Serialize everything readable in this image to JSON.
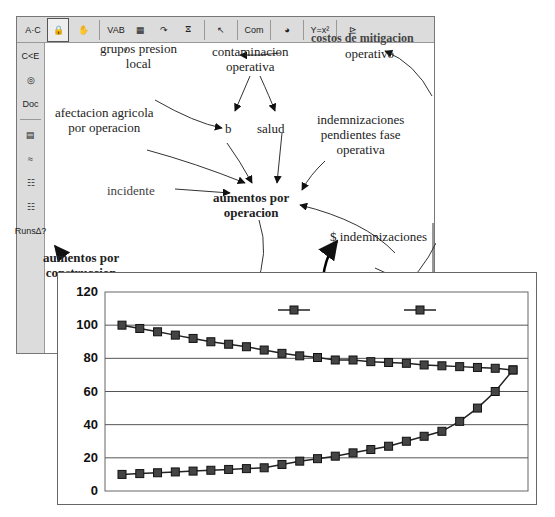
{
  "toolbar": {
    "items": [
      {
        "name": "text-tool",
        "glyph": "A·C"
      },
      {
        "name": "lock-tool",
        "glyph": "🔒",
        "selected": true
      },
      {
        "name": "hand-tool",
        "glyph": "✋"
      },
      {
        "name": "variable-tool",
        "glyph": "VAB"
      },
      {
        "name": "box-variable-tool",
        "glyph": "▦"
      },
      {
        "name": "arrow-tool",
        "glyph": "↷"
      },
      {
        "name": "rate-tool",
        "glyph": "⧖"
      },
      {
        "name": "shadow-variable-tool",
        "glyph": "↖"
      },
      {
        "name": "comment-tool",
        "glyph": "Com"
      },
      {
        "name": "delete-tool",
        "glyph": "◕"
      },
      {
        "name": "equations-tool",
        "glyph": "Y=x²"
      },
      {
        "name": "reference-mode-tool",
        "glyph": "⊵"
      }
    ]
  },
  "sidebar": {
    "items": [
      {
        "name": "causes-tree",
        "glyph": "C<E"
      },
      {
        "name": "loops",
        "glyph": "◎"
      },
      {
        "name": "document",
        "glyph": "Doc"
      },
      {
        "name": "causes-strip",
        "glyph": "▤"
      },
      {
        "name": "graph",
        "glyph": "≈"
      },
      {
        "name": "table",
        "glyph": "☷"
      },
      {
        "name": "table-time-down",
        "glyph": "☷"
      },
      {
        "name": "runs-compare",
        "glyph": "Runs∆?"
      }
    ]
  },
  "diagram": {
    "nodes": {
      "top_right_cut": "costos de mitigacion",
      "operativo": "operativo",
      "grupos_presion": "grupos presion\nlocal",
      "contaminacion": "contaminacion\noperativa",
      "afectacion": "afectacion agricola\npor operacion",
      "b": "b",
      "salud": "salud",
      "indemnizaciones_pend": "indemnizaciones\npendientes fase\noperativa",
      "incidente": "incidente",
      "aumentos_operacion": "aumentos por\noperacion",
      "indemnizaciones": "$ indemnizaciones",
      "aumentos_construccion": "aumentos por\nconstruccion"
    }
  },
  "chart_data": {
    "type": "line",
    "title": "",
    "xlabel": "",
    "ylabel": "",
    "ylim": [
      0,
      120
    ],
    "yticks": [
      0,
      20,
      40,
      60,
      80,
      100,
      120
    ],
    "grid": true,
    "legend_position": "top",
    "x": [
      1,
      2,
      3,
      4,
      5,
      6,
      7,
      8,
      9,
      10,
      11,
      12,
      13,
      14,
      15,
      16,
      17,
      18,
      19,
      20,
      21,
      22,
      23
    ],
    "series": [
      {
        "name": "Construcción",
        "marker": "square",
        "values": [
          100,
          98,
          96,
          94,
          92,
          90,
          88.5,
          87,
          85,
          83,
          81.5,
          80.5,
          79,
          79,
          78,
          77.5,
          77,
          76,
          75.5,
          75,
          74.5,
          74,
          73
        ]
      },
      {
        "name": "Imdemnizaciones",
        "marker": "square",
        "values": [
          10,
          10.5,
          11,
          11.5,
          12,
          12.5,
          13,
          13.5,
          14,
          16,
          18,
          19.5,
          21,
          23,
          25,
          27,
          30,
          33,
          36,
          42,
          50,
          60,
          73
        ]
      }
    ]
  }
}
